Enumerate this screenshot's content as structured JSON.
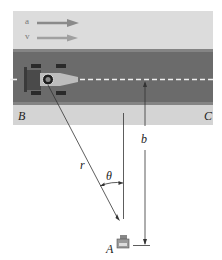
{
  "diagram": {
    "vectors": [
      {
        "label": "a",
        "description": "acceleration arrow"
      },
      {
        "label": "v",
        "description": "velocity arrow"
      }
    ],
    "points": {
      "B": "B",
      "C": "C",
      "A": "A"
    },
    "dimensions": {
      "r": "r",
      "theta": "θ",
      "b": "b"
    },
    "colors": {
      "top_band": "#dcdcdc",
      "road": "#6e6e6e",
      "road_edge": "#8a8a8a",
      "bottom_band": "#d6d6d6",
      "centerline": "#eeeeee",
      "arrow_a": "#888888",
      "arrow_v": "#9a9a9a",
      "lines": "#333333"
    }
  }
}
